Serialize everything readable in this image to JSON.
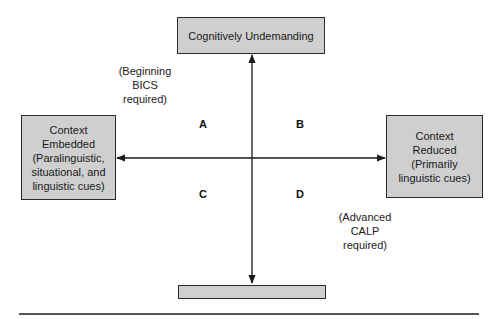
{
  "diagram": {
    "top_box": {
      "label": "Cognitively Undemanding"
    },
    "bottom_box": {
      "label": "Cognitively Demanding"
    },
    "left_box": {
      "line1": "Context",
      "line2": "Embedded",
      "line3": "(Paralinguistic,",
      "line4": "situational, and",
      "line5": "linguistic cues)"
    },
    "right_box": {
      "line1": "Context",
      "line2": "Reduced",
      "line3": "(Primarily",
      "line4": "linguistic cues)"
    },
    "note_bics": {
      "line1": "(Beginning",
      "line2": "BICS",
      "line3": "required)"
    },
    "note_calp": {
      "line1": "(Advanced",
      "line2": "CALP",
      "line3": "required)"
    },
    "quadrants": {
      "a": "A",
      "b": "B",
      "c": "C",
      "d": "D"
    },
    "colors": {
      "box_fill": "#cfcfcf",
      "line": "#1a1a1a"
    }
  }
}
